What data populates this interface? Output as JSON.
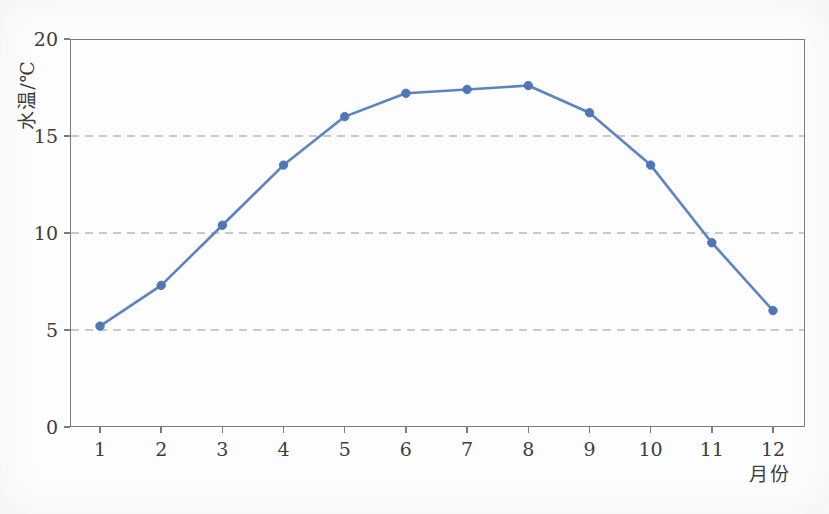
{
  "chart_data": {
    "type": "line",
    "title": "",
    "xlabel": "月份",
    "ylabel": "水温/℃",
    "x": [
      1,
      2,
      3,
      4,
      5,
      6,
      7,
      8,
      9,
      10,
      11,
      12
    ],
    "series": [
      {
        "name": "水温",
        "values": [
          5.2,
          7.3,
          10.4,
          13.5,
          16.0,
          17.2,
          17.4,
          17.6,
          16.2,
          13.5,
          9.5,
          6.0
        ]
      }
    ],
    "ylim": [
      0,
      20
    ],
    "yticks": [
      0,
      5,
      10,
      15,
      20
    ],
    "gridlines": {
      "y": [
        5,
        10,
        15
      ],
      "style": "dashed"
    },
    "legend_position": "none",
    "marker": "circle"
  },
  "colors": {
    "line": "#5b84c2",
    "marker": "#4d77b6",
    "axis": "#7c7c7c",
    "grid": "#c9c9c9",
    "text": "#3d3d3d",
    "background": "#fdfdfd"
  }
}
